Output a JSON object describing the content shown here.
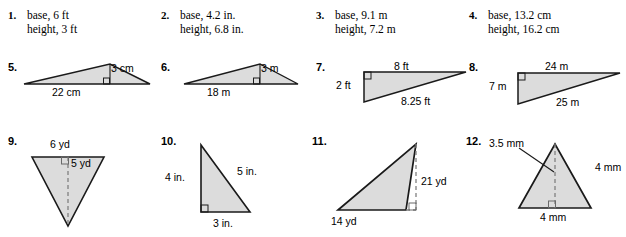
{
  "worksheet": {
    "problems": [
      {
        "number": "1.",
        "type": "text",
        "lines": [
          "base, 6 ft",
          "height, 3 ft"
        ],
        "base": "6 ft",
        "height": "3 ft"
      },
      {
        "number": "2.",
        "type": "text",
        "lines": [
          "base, 4.2 in.",
          "height, 6.8 in."
        ],
        "base": "4.2 in.",
        "height": "6.8 in."
      },
      {
        "number": "3.",
        "type": "text",
        "lines": [
          "base, 9.1 m",
          "height, 7.2 m"
        ],
        "base": "9.1 m",
        "height": "7.2 m"
      },
      {
        "number": "4.",
        "type": "text",
        "lines": [
          "base, 13.2 cm",
          "height, 16.2 cm"
        ],
        "base": "13.2 cm",
        "height": "16.2 cm"
      },
      {
        "number": "5.",
        "type": "figure",
        "shape": "wide-flat-triangle",
        "labels": {
          "height": "3 cm",
          "base": "22 cm"
        }
      },
      {
        "number": "6.",
        "type": "figure",
        "shape": "wide-flat-triangle",
        "labels": {
          "height": "3 m",
          "base": "18 m"
        }
      },
      {
        "number": "7.",
        "type": "figure",
        "shape": "right-triangle-top-left",
        "labels": {
          "top": "8 ft",
          "left": "2 ft",
          "hypotenuse": "8.25 ft"
        }
      },
      {
        "number": "8.",
        "type": "figure",
        "shape": "right-triangle-top-left",
        "labels": {
          "top": "24 m",
          "left": "7 m",
          "hypotenuse": "25 m"
        }
      },
      {
        "number": "9.",
        "type": "figure",
        "shape": "inverted-triangle",
        "labels": {
          "base": "6 yd",
          "height": "5 yd"
        }
      },
      {
        "number": "10.",
        "type": "figure",
        "shape": "right-triangle-bottom-left",
        "labels": {
          "left": "4 in.",
          "hypotenuse": "5 in.",
          "base": "3 in."
        }
      },
      {
        "number": "11.",
        "type": "figure",
        "shape": "obtuse-triangle-external-height",
        "labels": {
          "height": "21 yd",
          "base": "14 yd"
        }
      },
      {
        "number": "12.",
        "type": "figure",
        "shape": "isosceles-triangle",
        "labels": {
          "height": "3.5 mm",
          "side": "4 mm",
          "base": "4 mm"
        }
      }
    ]
  },
  "style": {
    "figure_fill": "#dcdcdc",
    "figure_stroke": "#1a1a1a",
    "dashed_stroke": "#707070",
    "text_color": "#000000",
    "background": "#ffffff"
  }
}
